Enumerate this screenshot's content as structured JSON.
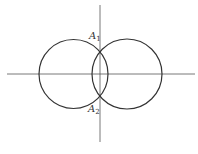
{
  "diagram": {
    "type": "two intersecting circles on coordinate axes",
    "colors": {
      "stroke": "#333333",
      "axis": "#555555",
      "background": "#ffffff"
    },
    "axes": {
      "horizontal": {
        "x1": 7,
        "y1": 74,
        "x2": 195,
        "y2": 74
      },
      "vertical": {
        "x1": 100,
        "y1": 5,
        "x2": 100,
        "y2": 142
      }
    },
    "circles": [
      {
        "name": "left-circle",
        "cx": 73.5,
        "cy": 74,
        "r": 34.5
      },
      {
        "name": "right-circle",
        "cx": 127,
        "cy": 74,
        "r": 35
      }
    ],
    "points": [
      {
        "name": "A1",
        "letter": "A",
        "subscript": "1",
        "x": 100,
        "y": 51,
        "label_x": 89,
        "label_y": 39
      },
      {
        "name": "A2",
        "letter": "A",
        "subscript": "2",
        "x": 100,
        "y": 97,
        "label_x": 88,
        "label_y": 112
      }
    ]
  }
}
